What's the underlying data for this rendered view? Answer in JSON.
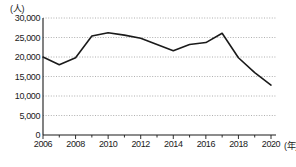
{
  "chart_data": {
    "type": "line",
    "title": "",
    "xlabel": "(年)",
    "ylabel": "(人)",
    "x": [
      2006,
      2007,
      2008,
      2009,
      2010,
      2011,
      2012,
      2013,
      2014,
      2015,
      2016,
      2017,
      2018,
      2019,
      2020
    ],
    "values": [
      20000,
      18000,
      19800,
      25400,
      26200,
      25600,
      24800,
      23200,
      21600,
      23200,
      23700,
      26100,
      19800,
      16000,
      12800
    ],
    "series": [
      {
        "name": "人数",
        "values": [
          20000,
          18000,
          19800,
          25400,
          26200,
          25600,
          24800,
          23200,
          21600,
          23200,
          23700,
          26100,
          19800,
          16000,
          12800
        ]
      }
    ],
    "ylim": [
      0,
      30000
    ],
    "xlim": [
      2006,
      2020
    ],
    "yticks": [
      0,
      5000,
      10000,
      15000,
      20000,
      25000,
      30000
    ],
    "ytick_labels": [
      "0",
      "5,000",
      "10,000",
      "15,000",
      "20,000",
      "25,000",
      "30,000"
    ],
    "xticks": [
      2006,
      2008,
      2010,
      2012,
      2014,
      2016,
      2018,
      2020
    ],
    "xtick_labels": [
      "2006",
      "2008",
      "2010",
      "2012",
      "2014",
      "2016",
      "2018",
      "2020"
    ],
    "grid": true,
    "grid_style": "dotted-horizontal",
    "legend": "none",
    "line_color": "#1a1a1a",
    "grid_color": "#9a9a9a",
    "axis_color": "#1a1a1a",
    "background": "#ffffff"
  },
  "axis": {
    "y_unit_label": "(人)",
    "x_unit_label": "(年)"
  }
}
